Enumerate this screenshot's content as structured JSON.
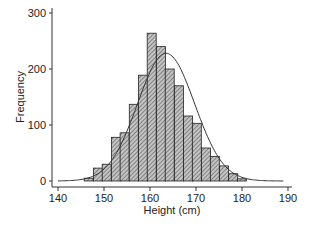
{
  "chart_data": {
    "type": "bar",
    "subtype": "histogram-with-normal-curve",
    "title": "",
    "xlabel": "Height (cm)",
    "ylabel": "Frequency",
    "xlim": [
      140,
      190
    ],
    "ylim": [
      0,
      300
    ],
    "xticks": [
      140,
      150,
      160,
      170,
      180,
      190
    ],
    "yticks": [
      0,
      100,
      200,
      300
    ],
    "grid": false,
    "legend": null,
    "bin_width": 1.96,
    "bins_start": [
      145.7,
      147.7,
      149.6,
      151.6,
      153.5,
      155.5,
      157.5,
      159.4,
      161.4,
      163.3,
      165.3,
      167.3,
      169.2,
      171.2,
      173.1,
      175.1,
      177.1,
      179.0
    ],
    "values": [
      5,
      23,
      30,
      78,
      86,
      137,
      189,
      264,
      240,
      200,
      170,
      116,
      103,
      59,
      44,
      27,
      13,
      4
    ],
    "normal_curve": {
      "mean": 163.5,
      "sd": 6.2,
      "peak_frequency": 228
    },
    "bar_fill": "hatched-gray",
    "colors": {
      "bar_fill": "#b8b8b8",
      "hatch": "#444444",
      "outline": "#222222",
      "curve": "#333333",
      "axis": "#333333"
    }
  }
}
